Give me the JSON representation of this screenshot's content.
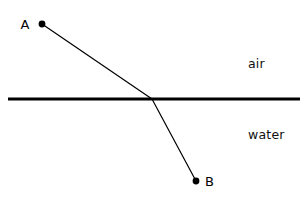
{
  "figure": {
    "kind": "refraction-diagram",
    "background_color": "#ffffff",
    "ink_color": "#000000",
    "width": 306,
    "height": 200
  },
  "media": {
    "upper": {
      "name": "air",
      "label": "air",
      "label_x": 248,
      "label_y": 68
    },
    "lower": {
      "name": "water",
      "label": "water",
      "label_x": 248,
      "label_y": 139
    }
  },
  "boundary": {
    "name": "air-water-interface",
    "x1": 8,
    "y1": 99,
    "x2": 300,
    "y2": 99,
    "stroke_width": 3,
    "color": "#000000"
  },
  "points": [
    {
      "id": "A",
      "label": "A",
      "dot_x": 42,
      "dot_y": 24,
      "dot_radius": 3.4,
      "label_x": 25,
      "label_y": 29,
      "medium": "air"
    },
    {
      "id": "B",
      "label": "B",
      "dot_x": 196,
      "dot_y": 181,
      "dot_radius": 3.4,
      "label_x": 205,
      "label_y": 186,
      "medium": "water"
    }
  ],
  "ray": {
    "name": "light-ray-path",
    "color": "#000000",
    "stroke_width": 1.2,
    "incident_segment": {
      "label": "incident-ray",
      "x1": 42,
      "y1": 24,
      "x2": 152,
      "y2": 99
    },
    "refracted_segment": {
      "label": "refracted-ray",
      "x1": 152,
      "y1": 99,
      "x2": 196,
      "y2": 181
    },
    "incidence_point": {
      "x": 152,
      "y": 99
    }
  }
}
